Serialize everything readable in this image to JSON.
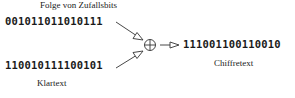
{
  "diagram": {
    "random_bits_label": "Folge von Zufallsbits",
    "random_bits": "001011011010111",
    "plaintext_bits": "110010111100101",
    "plaintext_label": "Klartext",
    "operator_symbol": "xor-circled-plus",
    "ciphertext_bits": "111001100110010",
    "ciphertext_label": "Chiffretext"
  }
}
